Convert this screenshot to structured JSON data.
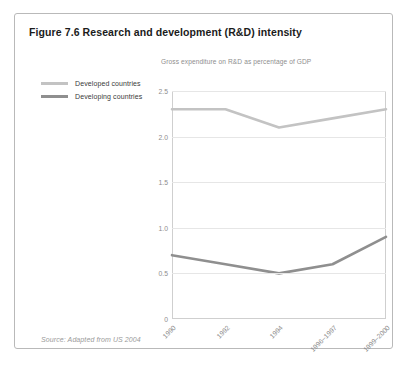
{
  "figure": {
    "title": "Figure 7.6 Research and development (R&D) intensity",
    "source": "Source: Adapted from US 2004"
  },
  "colors": {
    "developed": "#c3c3c3",
    "developing": "#8f8f8f",
    "grid": "#e6e6e6",
    "axis": "#cfcfcf",
    "tick_text": "#8d8d8d",
    "border": "#b9b9b9",
    "title_text": "#1b1b1b",
    "subtitle_text": "#8e8e8e",
    "source_text": "#9a9a9a"
  },
  "chart_data": {
    "type": "line",
    "title": "Gross expenditure on R&D as percentage of GDP",
    "xlabel": "",
    "ylabel": "",
    "categories": [
      "1990",
      "1992",
      "1994",
      "1996–1997",
      "1999–2000"
    ],
    "ylim": [
      0,
      2.5
    ],
    "yticks": [
      "0",
      "0.5",
      "1.0",
      "1.5",
      "2.0",
      "2.5"
    ],
    "ytick_values": [
      0,
      0.5,
      1.0,
      1.5,
      2.0,
      2.5
    ],
    "grid": true,
    "legend_position": "left-outside",
    "series": [
      {
        "name": "Developed countries",
        "color": "#c3c3c3",
        "values": [
          2.3,
          2.3,
          2.1,
          2.2,
          2.3
        ]
      },
      {
        "name": "Developing countries",
        "color": "#8f8f8f",
        "values": [
          0.7,
          0.6,
          0.5,
          0.6,
          0.9
        ]
      }
    ]
  }
}
